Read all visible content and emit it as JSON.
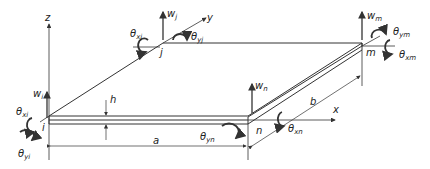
{
  "diagram": {
    "axes": {
      "x": "x",
      "y": "y",
      "z": "z"
    },
    "dimensions": {
      "length": "a",
      "width": "b",
      "thickness": "h"
    },
    "nodes": [
      {
        "id": "i",
        "dofs": {
          "w": {
            "base": "w",
            "sub": "i"
          },
          "thx": {
            "base": "θ",
            "sub": "xi"
          },
          "thy": {
            "base": "θ",
            "sub": "yi"
          }
        }
      },
      {
        "id": "j",
        "dofs": {
          "w": {
            "base": "w",
            "sub": "j"
          },
          "thx": {
            "base": "θ",
            "sub": "xj"
          },
          "thy": {
            "base": "θ",
            "sub": "yj"
          }
        }
      },
      {
        "id": "m",
        "dofs": {
          "w": {
            "base": "w",
            "sub": "m"
          },
          "thx": {
            "base": "θ",
            "sub": "xm"
          },
          "thy": {
            "base": "θ",
            "sub": "ym"
          }
        }
      },
      {
        "id": "n",
        "dofs": {
          "w": {
            "base": "w",
            "sub": "n"
          },
          "thx": {
            "base": "θ",
            "sub": "xn"
          },
          "thy": {
            "base": "θ",
            "sub": "yn"
          }
        }
      }
    ],
    "colors": {
      "line": "#333333",
      "text": "#222222",
      "background": "#ffffff"
    }
  }
}
